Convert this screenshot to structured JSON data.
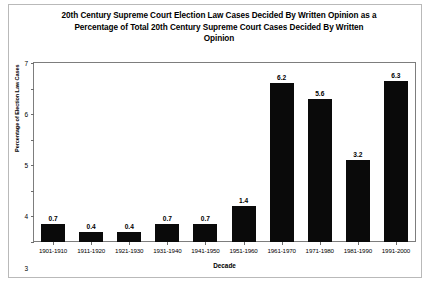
{
  "chart_data": {
    "type": "bar",
    "title": "20th Century Supreme Court Election Law Cases Decided By Written Opinion as a Percentage of Total 20th Century Supreme Court Cases Decided By Written Opinion",
    "title_lines": [
      "20th Century Supreme Court Election Law Cases Decided By Written Opinion as a",
      "Percentage of Total 20th Century Supreme Court Cases Decided By Written",
      "Opinion"
    ],
    "xlabel": "Decade",
    "ylabel": "Percentage of Election Law Cases",
    "ylim": [
      0,
      7
    ],
    "yticks": [
      0,
      1,
      2,
      3,
      4,
      5,
      6,
      7
    ],
    "grid": false,
    "legend": false,
    "bar_color": "#0a0a0a",
    "categories": [
      "1901-1910",
      "1911-1920",
      "1921-1930",
      "1931-1940",
      "1941-1950",
      "1951-1960",
      "1961-1970",
      "1971-1980",
      "1981-1990",
      "1991-2000"
    ],
    "values": [
      0.7,
      0.4,
      0.4,
      0.7,
      0.7,
      1.4,
      6.2,
      5.6,
      3.2,
      6.3
    ],
    "value_labels": [
      "0.7",
      "0.4",
      "0.4",
      "0.7",
      "0.7",
      "1.4",
      "6.2",
      "5.6",
      "3.2",
      "6.3"
    ]
  }
}
